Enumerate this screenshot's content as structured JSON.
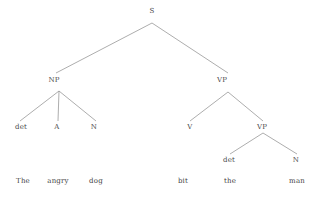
{
  "diagram": {
    "kind": "constituency-syntax-tree",
    "sentence": "The angry dog bit the man",
    "background_color": "#ffffff",
    "line_color": "#8a8a8a",
    "text_color": "#4a4a4a"
  },
  "nodes": [
    {
      "id": "s",
      "label": "S",
      "x": 152,
      "y": 11,
      "level": 0
    },
    {
      "id": "np",
      "label": "NP",
      "x": 54,
      "y": 80,
      "level": 1
    },
    {
      "id": "vp",
      "label": "VP",
      "x": 222,
      "y": 80,
      "level": 1
    },
    {
      "id": "det1",
      "label": "det",
      "x": 21,
      "y": 127,
      "level": 2
    },
    {
      "id": "a1",
      "label": "A",
      "x": 57,
      "y": 127,
      "level": 2
    },
    {
      "id": "n1",
      "label": "N",
      "x": 94,
      "y": 127,
      "level": 2
    },
    {
      "id": "v1",
      "label": "V",
      "x": 190,
      "y": 127,
      "level": 2
    },
    {
      "id": "vp2",
      "label": "VP",
      "x": 262,
      "y": 127,
      "level": 2
    },
    {
      "id": "det2",
      "label": "det",
      "x": 229,
      "y": 160,
      "level": 3
    },
    {
      "id": "n2",
      "label": "N",
      "x": 296,
      "y": 160,
      "level": 3
    }
  ],
  "edges": [
    {
      "id": "e-s-np",
      "from": "s",
      "to": "np",
      "x1": 152,
      "y1": 23,
      "x2": 56,
      "y2": 73
    },
    {
      "id": "e-s-vp",
      "from": "s",
      "to": "vp",
      "x1": 152,
      "y1": 23,
      "x2": 228,
      "y2": 73
    },
    {
      "id": "e-np-det",
      "from": "np",
      "to": "det1",
      "x1": 59,
      "y1": 91,
      "x2": 20,
      "y2": 121
    },
    {
      "id": "e-np-a",
      "from": "np",
      "to": "a1",
      "x1": 59,
      "y1": 91,
      "x2": 58,
      "y2": 121
    },
    {
      "id": "e-np-n",
      "from": "np",
      "to": "n1",
      "x1": 59,
      "y1": 91,
      "x2": 96,
      "y2": 121
    },
    {
      "id": "e-vp-v",
      "from": "vp",
      "to": "v1",
      "x1": 228,
      "y1": 92,
      "x2": 190,
      "y2": 121
    },
    {
      "id": "e-vp-vp2",
      "from": "vp",
      "to": "vp2",
      "x1": 228,
      "y1": 92,
      "x2": 263,
      "y2": 121
    },
    {
      "id": "e-vp2-det2",
      "from": "vp2",
      "to": "det2",
      "x1": 263,
      "y1": 133,
      "x2": 230,
      "y2": 154
    },
    {
      "id": "e-vp2-n2",
      "from": "vp2",
      "to": "n2",
      "x1": 263,
      "y1": 133,
      "x2": 297,
      "y2": 154
    }
  ],
  "terminals": [
    {
      "id": "w-the1",
      "label": "The",
      "x": 23,
      "y": 181,
      "parent": "det1"
    },
    {
      "id": "w-angry",
      "label": "angry",
      "x": 58,
      "y": 181,
      "parent": "a1"
    },
    {
      "id": "w-dog",
      "label": "dog",
      "x": 96,
      "y": 181,
      "parent": "n1"
    },
    {
      "id": "w-bit",
      "label": "bit",
      "x": 183,
      "y": 181,
      "parent": "v1"
    },
    {
      "id": "w-the2",
      "label": "the",
      "x": 230,
      "y": 181,
      "parent": "det2"
    },
    {
      "id": "w-man",
      "label": "man",
      "x": 297,
      "y": 181,
      "parent": "n2"
    }
  ]
}
